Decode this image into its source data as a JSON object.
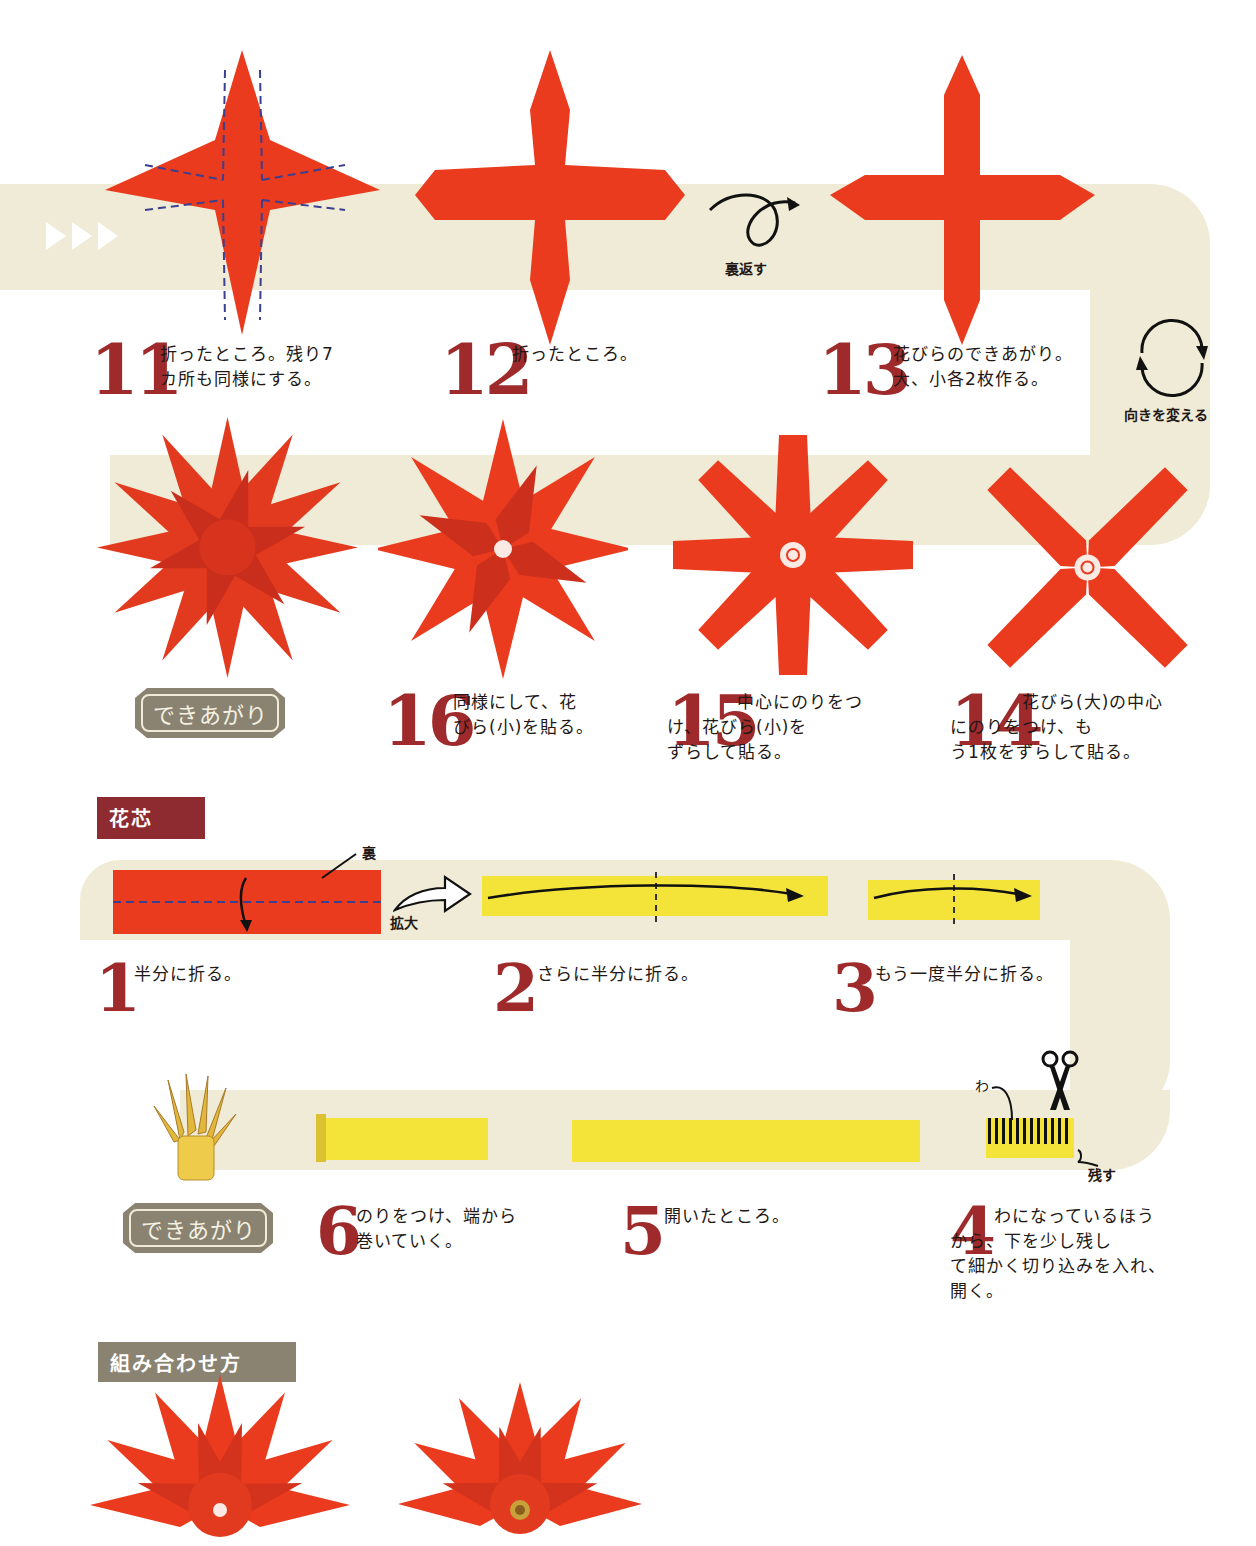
{
  "colors": {
    "paper_red": "#ea3b1e",
    "step_number": "#9e2a2b",
    "band": "#efebd6",
    "yellow_paper": "#f4e43a",
    "section_flower_core_bg": "#8e2b30",
    "section_assembly_bg": "#8a8371",
    "done_badge_bg": "#8a8371"
  },
  "continue_marker": {
    "icon": "triple-play-arrows"
  },
  "petals": {
    "steps": [
      {
        "number": "11",
        "text": "折ったところ。残り7\nカ所も同様にする。"
      },
      {
        "number": "12",
        "text": "折ったところ。"
      },
      {
        "number": "13",
        "text": "花びらのできあがり。\n大、小各2枚作る。"
      },
      {
        "number": "14",
        "text": "花びら(大)の中心\nにのりをつけ、も\nう1枚をずらして貼る。"
      },
      {
        "number": "15",
        "text": "中心にのりをつ\nけ、花びら(小)を\nずらして貼る。"
      },
      {
        "number": "16",
        "text": "同様にして、花\nびら(小)を貼る。"
      }
    ],
    "flip_label": "裏返す",
    "rotate_label": "向きを変える",
    "done_label": "できあがり"
  },
  "flower_core": {
    "section_title": "花芯",
    "back_label": "裏",
    "enlarge_label": "拡大",
    "loop_label": "わ",
    "leave_label": "残す",
    "steps": [
      {
        "number": "1",
        "text": "半分に折る。"
      },
      {
        "number": "2",
        "text": "さらに半分に折る。"
      },
      {
        "number": "3",
        "text": "もう一度半分に折る。"
      },
      {
        "number": "4",
        "text": "わになっているほう\nから、下を少し残し\nて細かく切り込みを入れ、\n開く。"
      },
      {
        "number": "5",
        "text": "開いたところ。"
      },
      {
        "number": "6",
        "text": "のりをつけ、端から\n巻いていく。"
      }
    ],
    "done_label": "できあがり"
  },
  "assembly": {
    "section_title": "組み合わせ方"
  }
}
